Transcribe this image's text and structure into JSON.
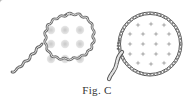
{
  "figure": {
    "caption": "Fig.  C",
    "left_illustration": {
      "name": "rickrack-trimmed-circle",
      "trim": "wavy rickrack braid",
      "dot_grid": {
        "rows": 3,
        "cols": 3
      },
      "dot_color": "#d6d6d6",
      "border_color": "#7a7a7a"
    },
    "right_illustration": {
      "name": "chain-stitch-trimmed-circle",
      "trim": "chain stitch braid",
      "motif_grid": {
        "rows": 5,
        "cols": 4
      },
      "motif_color": "#b8b8b8",
      "border_color": "#6a6a6a"
    }
  }
}
